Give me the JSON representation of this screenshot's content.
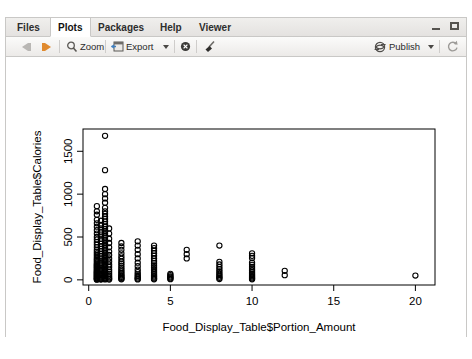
{
  "window": {
    "minimize_icon": "minimize-icon",
    "maximize_icon": "maximize-icon"
  },
  "tabs": [
    {
      "label": "Files",
      "active": false
    },
    {
      "label": "Plots",
      "active": true
    },
    {
      "label": "Packages",
      "active": false
    },
    {
      "label": "Help",
      "active": false
    },
    {
      "label": "Viewer",
      "active": false
    }
  ],
  "toolbar": {
    "back_icon": "back-arrow-icon",
    "forward_icon": "forward-arrow-icon",
    "zoom_label": "Zoom",
    "zoom_icon": "magnifier-icon",
    "export_label": "Export",
    "export_icon": "export-icon",
    "export_caret": "chevron-down-icon",
    "remove_icon": "remove-plot-icon",
    "clear_icon": "broom-clear-icon",
    "publish_label": "Publish",
    "publish_icon": "publish-icon",
    "publish_caret": "chevron-down-icon",
    "refresh_icon": "refresh-icon"
  },
  "chart_data": {
    "type": "scatter",
    "title": "",
    "xlabel": "Food_Display_Table$Portion_Amount",
    "ylabel": "Food_Display_Table$Calories",
    "xlim": [
      -0.35,
      21.2
    ],
    "ylim": [
      -60,
      1760
    ],
    "xticks": [
      0,
      5,
      10,
      15,
      20
    ],
    "yticks": [
      0,
      500,
      1000,
      1500
    ],
    "grid": false,
    "legend": null,
    "marker": "open-circle",
    "marker_color": "#000000",
    "points": [
      [
        1,
        1680
      ],
      [
        1,
        1280
      ],
      [
        1,
        1060
      ],
      [
        1,
        1000
      ],
      [
        1,
        950
      ],
      [
        1,
        900
      ],
      [
        0.5,
        860
      ],
      [
        0.5,
        800
      ],
      [
        0.5,
        760
      ],
      [
        0.5,
        700
      ],
      [
        0.5,
        660
      ],
      [
        0.5,
        620
      ],
      [
        0.5,
        580
      ],
      [
        0.5,
        540
      ],
      [
        0.5,
        500
      ],
      [
        0.5,
        470
      ],
      [
        0.5,
        440
      ],
      [
        0.5,
        410
      ],
      [
        0.5,
        380
      ],
      [
        0.5,
        350
      ],
      [
        0.5,
        330
      ],
      [
        0.5,
        310
      ],
      [
        0.5,
        290
      ],
      [
        0.5,
        270
      ],
      [
        0.5,
        250
      ],
      [
        0.5,
        235
      ],
      [
        0.5,
        220
      ],
      [
        0.5,
        205
      ],
      [
        0.5,
        190
      ],
      [
        0.5,
        180
      ],
      [
        0.5,
        170
      ],
      [
        0.5,
        160
      ],
      [
        0.5,
        150
      ],
      [
        0.5,
        140
      ],
      [
        0.5,
        130
      ],
      [
        0.5,
        120
      ],
      [
        0.5,
        110
      ],
      [
        0.5,
        100
      ],
      [
        0.5,
        92
      ],
      [
        0.5,
        85
      ],
      [
        0.5,
        78
      ],
      [
        0.5,
        70
      ],
      [
        0.5,
        62
      ],
      [
        0.5,
        55
      ],
      [
        0.5,
        48
      ],
      [
        0.5,
        40
      ],
      [
        0.5,
        32
      ],
      [
        0.5,
        25
      ],
      [
        0.5,
        18
      ],
      [
        0.5,
        12
      ],
      [
        0.5,
        6
      ],
      [
        0.5,
        2
      ],
      [
        0.75,
        690
      ],
      [
        0.75,
        640
      ],
      [
        0.75,
        600
      ],
      [
        0.75,
        560
      ],
      [
        0.75,
        520
      ],
      [
        0.75,
        480
      ],
      [
        0.75,
        450
      ],
      [
        0.75,
        420
      ],
      [
        0.75,
        390
      ],
      [
        0.75,
        360
      ],
      [
        0.75,
        335
      ],
      [
        0.75,
        305
      ],
      [
        0.75,
        280
      ],
      [
        0.75,
        260
      ],
      [
        0.75,
        240
      ],
      [
        0.75,
        215
      ],
      [
        0.75,
        195
      ],
      [
        0.75,
        175
      ],
      [
        0.75,
        158
      ],
      [
        0.75,
        142
      ],
      [
        0.75,
        126
      ],
      [
        0.75,
        112
      ],
      [
        0.75,
        98
      ],
      [
        0.75,
        84
      ],
      [
        0.75,
        70
      ],
      [
        0.75,
        56
      ],
      [
        0.75,
        44
      ],
      [
        0.75,
        32
      ],
      [
        0.75,
        20
      ],
      [
        0.75,
        10
      ],
      [
        0.75,
        3
      ],
      [
        1,
        840
      ],
      [
        1,
        800
      ],
      [
        1,
        770
      ],
      [
        1,
        740
      ],
      [
        1,
        710
      ],
      [
        1,
        680
      ],
      [
        1,
        650
      ],
      [
        1,
        620
      ],
      [
        1,
        595
      ],
      [
        1,
        570
      ],
      [
        1,
        545
      ],
      [
        1,
        520
      ],
      [
        1,
        495
      ],
      [
        1,
        470
      ],
      [
        1,
        450
      ],
      [
        1,
        430
      ],
      [
        1,
        410
      ],
      [
        1,
        390
      ],
      [
        1,
        370
      ],
      [
        1,
        350
      ],
      [
        1,
        332
      ],
      [
        1,
        314
      ],
      [
        1,
        297
      ],
      [
        1,
        280
      ],
      [
        1,
        264
      ],
      [
        1,
        248
      ],
      [
        1,
        232
      ],
      [
        1,
        217
      ],
      [
        1,
        202
      ],
      [
        1,
        188
      ],
      [
        1,
        174
      ],
      [
        1,
        160
      ],
      [
        1,
        147
      ],
      [
        1,
        134
      ],
      [
        1,
        122
      ],
      [
        1,
        110
      ],
      [
        1,
        98
      ],
      [
        1,
        87
      ],
      [
        1,
        76
      ],
      [
        1,
        66
      ],
      [
        1,
        56
      ],
      [
        1,
        46
      ],
      [
        1,
        37
      ],
      [
        1,
        28
      ],
      [
        1,
        20
      ],
      [
        1,
        12
      ],
      [
        1,
        5
      ],
      [
        1.25,
        600
      ],
      [
        1.25,
        540
      ],
      [
        1.25,
        480
      ],
      [
        1.25,
        430
      ],
      [
        1.25,
        380
      ],
      [
        1.25,
        330
      ],
      [
        1.25,
        290
      ],
      [
        1.25,
        250
      ],
      [
        1.25,
        215
      ],
      [
        1.25,
        180
      ],
      [
        1.25,
        150
      ],
      [
        1.25,
        120
      ],
      [
        1.25,
        95
      ],
      [
        1.25,
        70
      ],
      [
        1.25,
        48
      ],
      [
        1.25,
        30
      ],
      [
        1.25,
        15
      ],
      [
        1.25,
        4
      ],
      [
        2,
        430
      ],
      [
        2,
        390
      ],
      [
        2,
        350
      ],
      [
        2,
        310
      ],
      [
        2,
        275
      ],
      [
        2,
        245
      ],
      [
        2,
        215
      ],
      [
        2,
        190
      ],
      [
        2,
        165
      ],
      [
        2,
        140
      ],
      [
        2,
        120
      ],
      [
        2,
        100
      ],
      [
        2,
        82
      ],
      [
        2,
        65
      ],
      [
        2,
        50
      ],
      [
        2,
        36
      ],
      [
        2,
        24
      ],
      [
        2,
        14
      ],
      [
        2,
        6
      ],
      [
        3,
        450
      ],
      [
        3,
        400
      ],
      [
        3,
        350
      ],
      [
        3,
        300
      ],
      [
        3,
        250
      ],
      [
        3,
        200
      ],
      [
        3,
        160
      ],
      [
        3,
        120
      ],
      [
        3,
        90
      ],
      [
        3,
        65
      ],
      [
        3,
        45
      ],
      [
        3,
        28
      ],
      [
        3,
        14
      ],
      [
        3,
        5
      ],
      [
        4,
        400
      ],
      [
        4,
        370
      ],
      [
        4,
        340
      ],
      [
        4,
        310
      ],
      [
        4,
        280
      ],
      [
        4,
        250
      ],
      [
        4,
        220
      ],
      [
        4,
        195
      ],
      [
        4,
        170
      ],
      [
        4,
        148
      ],
      [
        4,
        126
      ],
      [
        4,
        105
      ],
      [
        4,
        86
      ],
      [
        4,
        68
      ],
      [
        4,
        52
      ],
      [
        4,
        38
      ],
      [
        4,
        25
      ],
      [
        4,
        14
      ],
      [
        4,
        6
      ],
      [
        5,
        70
      ],
      [
        5,
        55
      ],
      [
        5,
        40
      ],
      [
        5,
        28
      ],
      [
        5,
        16
      ],
      [
        5,
        8
      ],
      [
        6,
        350
      ],
      [
        6,
        300
      ],
      [
        6,
        250
      ],
      [
        8,
        400
      ],
      [
        8,
        210
      ],
      [
        8,
        180
      ],
      [
        8,
        150
      ],
      [
        8,
        125
      ],
      [
        8,
        100
      ],
      [
        8,
        78
      ],
      [
        8,
        58
      ],
      [
        8,
        40
      ],
      [
        8,
        24
      ],
      [
        8,
        10
      ],
      [
        10,
        310
      ],
      [
        10,
        280
      ],
      [
        10,
        255
      ],
      [
        10,
        200
      ],
      [
        10,
        175
      ],
      [
        10,
        150
      ],
      [
        10,
        128
      ],
      [
        10,
        108
      ],
      [
        10,
        90
      ],
      [
        10,
        72
      ],
      [
        10,
        56
      ],
      [
        10,
        42
      ],
      [
        10,
        28
      ],
      [
        10,
        16
      ],
      [
        10,
        6
      ],
      [
        12,
        105
      ],
      [
        12,
        55
      ],
      [
        20,
        50
      ]
    ]
  }
}
